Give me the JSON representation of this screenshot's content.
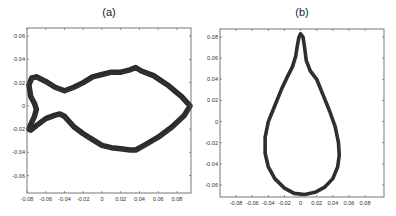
{
  "chart_data": [
    {
      "type": "line",
      "title": "(a)",
      "xlabel": "",
      "ylabel": "",
      "xlim": [
        -0.08,
        0.095
      ],
      "ylim": [
        -0.075,
        0.067
      ],
      "xticks": [
        -0.08,
        -0.06,
        -0.04,
        -0.02,
        0,
        0.02,
        0.04,
        0.06,
        0.08
      ],
      "xtick_labels": [
        "-0.08",
        "-0.06",
        "-0.04",
        "-0.02",
        "0",
        "0.02",
        "0.04",
        "0.06",
        "0.08"
      ],
      "yticks": [
        0.06,
        0.04,
        0.02,
        0,
        -0.02,
        -0.04,
        -0.06
      ],
      "ytick_labels": [
        "0.06",
        "0.04",
        "0.02",
        "0",
        "-0.02",
        "-0.04",
        "-0.06"
      ],
      "grid": false,
      "description": "Fish-shaped closed contour, many overlapping traces",
      "series": [
        {
          "name": "fish-contour",
          "closed": true,
          "x": [
            0.094,
            0.085,
            0.07,
            0.055,
            0.042,
            0.036,
            0.03,
            0.02,
            0.01,
            0.0,
            -0.01,
            -0.02,
            -0.03,
            -0.04,
            -0.05,
            -0.06,
            -0.07,
            -0.075,
            -0.078,
            -0.076,
            -0.072,
            -0.07,
            -0.072,
            -0.076,
            -0.078,
            -0.076,
            -0.07,
            -0.06,
            -0.05,
            -0.045,
            -0.04,
            -0.03,
            -0.02,
            -0.01,
            0.0,
            0.01,
            0.02,
            0.03,
            0.036,
            0.045,
            0.06,
            0.075,
            0.088,
            0.094
          ],
          "y": [
            0.0,
            0.008,
            0.018,
            0.026,
            0.03,
            0.033,
            0.031,
            0.029,
            0.029,
            0.027,
            0.025,
            0.02,
            0.016,
            0.013,
            0.016,
            0.021,
            0.025,
            0.024,
            0.018,
            0.008,
            0.002,
            -0.003,
            -0.009,
            -0.016,
            -0.02,
            -0.021,
            -0.017,
            -0.011,
            -0.008,
            -0.007,
            -0.009,
            -0.018,
            -0.024,
            -0.029,
            -0.034,
            -0.036,
            -0.037,
            -0.038,
            -0.038,
            -0.034,
            -0.027,
            -0.018,
            -0.008,
            0.0
          ]
        }
      ]
    },
    {
      "type": "line",
      "title": "(b)",
      "xlabel": "",
      "ylabel": "",
      "xlim": [
        -0.1,
        0.1035
      ],
      "ylim": [
        -0.0714,
        0.0876
      ],
      "xticks": [
        -0.08,
        -0.06,
        -0.04,
        -0.02,
        0,
        0.02,
        0.04,
        0.06,
        0.08
      ],
      "xtick_labels": [
        "-0.08",
        "-0.06",
        "-0.04",
        "-0.02",
        "0",
        "0.02",
        "0.04",
        "0.06",
        "0.08"
      ],
      "yticks": [
        0.08,
        0.06,
        0.04,
        0.02,
        0,
        -0.02,
        -0.04,
        -0.06
      ],
      "ytick_labels": [
        "0.08",
        "0.06",
        "0.04",
        "0.02",
        "0",
        "-0.02",
        "-0.04",
        "-0.06"
      ],
      "grid": false,
      "description": "Teardrop-shaped closed contour, many overlapping traces",
      "series": [
        {
          "name": "teardrop-contour",
          "closed": true,
          "x": [
            0.0,
            0.003,
            0.005,
            0.007,
            0.012,
            0.02,
            0.028,
            0.036,
            0.043,
            0.047,
            0.048,
            0.046,
            0.04,
            0.03,
            0.018,
            0.005,
            -0.008,
            -0.02,
            -0.032,
            -0.04,
            -0.044,
            -0.044,
            -0.04,
            -0.032,
            -0.024,
            -0.016,
            -0.01,
            -0.006,
            -0.004,
            -0.002,
            0.0
          ],
          "y": [
            0.083,
            0.08,
            0.07,
            0.058,
            0.048,
            0.04,
            0.025,
            0.01,
            -0.005,
            -0.02,
            -0.032,
            -0.043,
            -0.054,
            -0.062,
            -0.067,
            -0.069,
            -0.068,
            -0.063,
            -0.054,
            -0.043,
            -0.03,
            -0.015,
            0.0,
            0.015,
            0.03,
            0.043,
            0.052,
            0.062,
            0.072,
            0.08,
            0.083
          ]
        }
      ]
    }
  ]
}
